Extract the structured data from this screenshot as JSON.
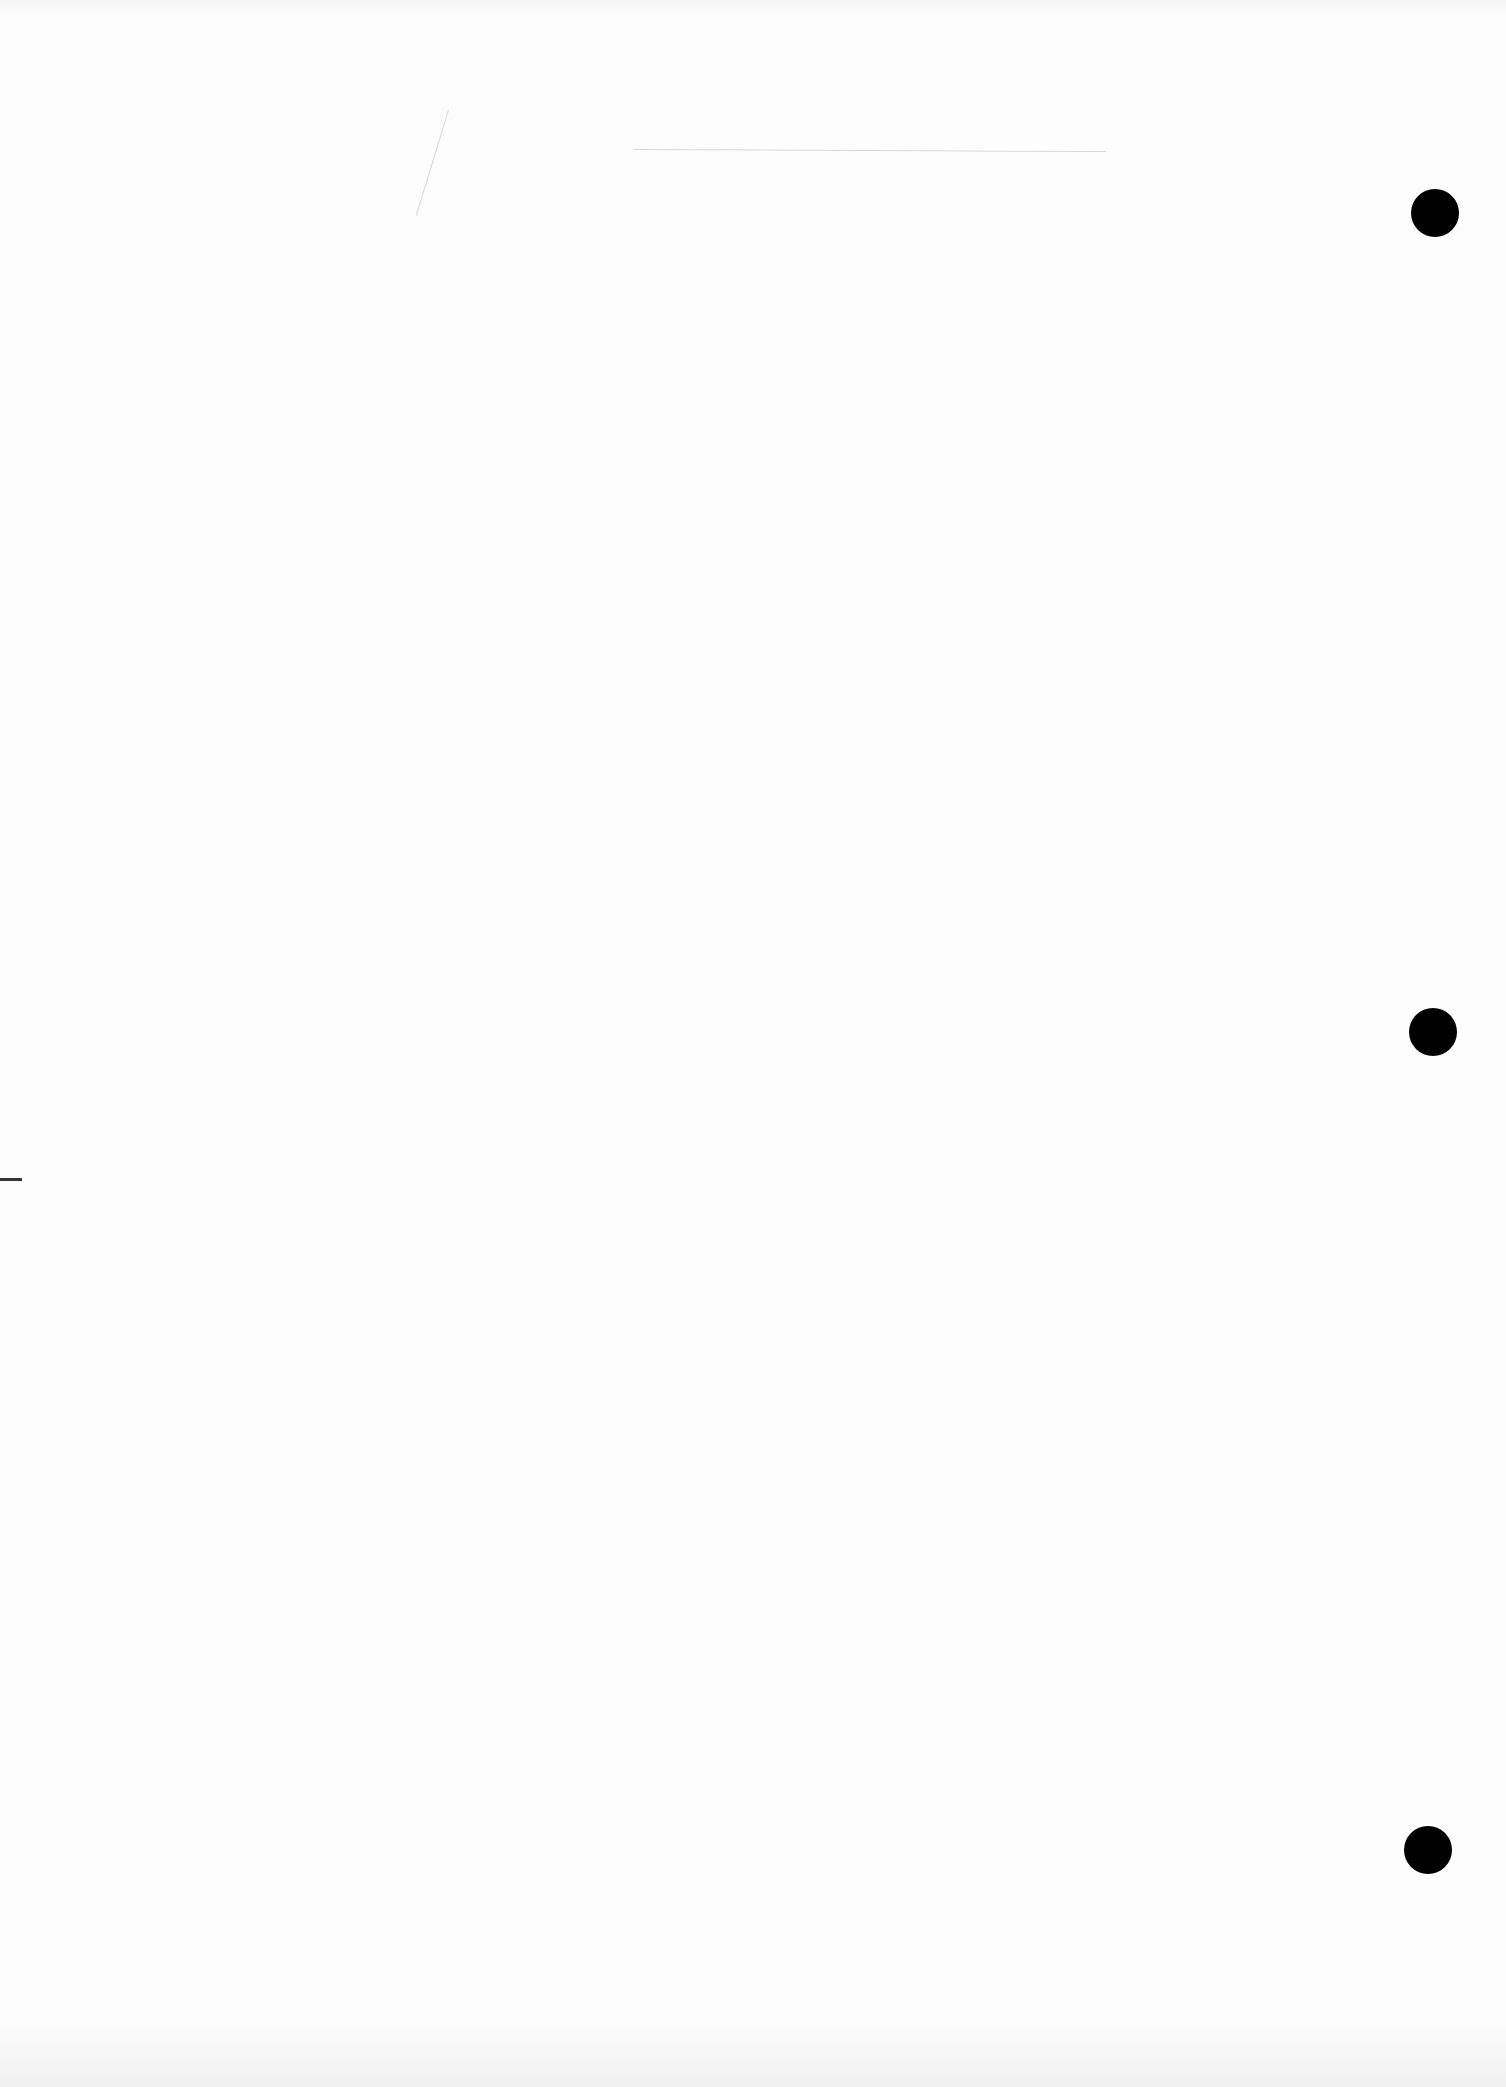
{
  "document": {
    "type": "blank scanned page",
    "text": "",
    "punch_holes": [
      {
        "x": 1435,
        "y": 213
      },
      {
        "x": 1433,
        "y": 1032
      },
      {
        "x": 1428,
        "y": 1850
      }
    ],
    "colors": {
      "paper": "#fdfdfd",
      "hole": "#000000",
      "rule": "#d8d8d8"
    }
  }
}
